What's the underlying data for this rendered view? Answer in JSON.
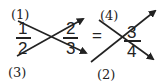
{
  "diagram": {
    "type": "fraction-cross-multiplication",
    "left_fraction": {
      "numerator": "1",
      "denominator": "2"
    },
    "middle_fraction": {
      "numerator": "2",
      "denominator": "3"
    },
    "equals": "=",
    "right_fraction": {
      "numerator": "3",
      "denominator": "4"
    },
    "step_labels": {
      "step1": "(1)",
      "step2": "(2)",
      "step3": "(3)",
      "step4": "(4)"
    },
    "colors": {
      "ink": "#222222",
      "background": "#ffffff"
    }
  }
}
